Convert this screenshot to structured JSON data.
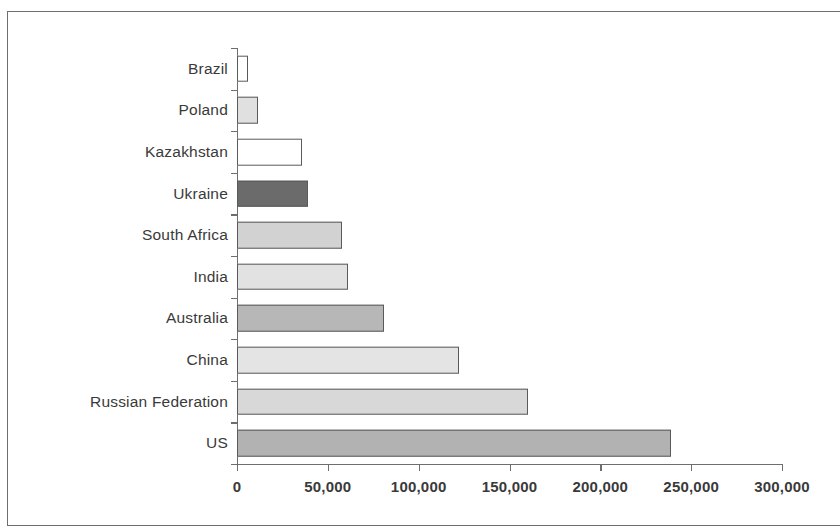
{
  "chart_data": {
    "type": "bar",
    "orientation": "horizontal",
    "title": "",
    "subtitle": "",
    "xlabel": "",
    "ylabel": "",
    "categories": [
      "Brazil",
      "Poland",
      "Kazakhstan",
      "Ukraine",
      "South Africa",
      "India",
      "Australia",
      "China",
      "Russian Federation",
      "US"
    ],
    "values": [
      6000,
      11500,
      36000,
      39000,
      58000,
      61000,
      81000,
      122000,
      160000,
      239000
    ],
    "series": [
      {
        "name": "Value",
        "values": [
          6000,
          11500,
          36000,
          39000,
          58000,
          61000,
          81000,
          122000,
          160000,
          239000
        ]
      }
    ],
    "bar_colors": [
      "#ffffff",
      "#e0e0e0",
      "#ffffff",
      "#6b6b6b",
      "#d2d2d2",
      "#e2e2e2",
      "#b7b7b7",
      "#e4e4e4",
      "#d8d8d8",
      "#b2b2b2"
    ],
    "bar_edge_color": "#5a5a5a",
    "axis_color": "#6e6e6e",
    "text_color": "#3a3a3a",
    "xlim": [
      0,
      300000
    ],
    "xticks": [
      0,
      50000,
      100000,
      150000,
      200000,
      250000,
      300000
    ],
    "xticklabels": [
      "0",
      "50,000",
      "100,000",
      "150,000",
      "200,000",
      "250,000",
      "300,000"
    ],
    "grid": false,
    "legend": false,
    "legend_position": "none"
  }
}
